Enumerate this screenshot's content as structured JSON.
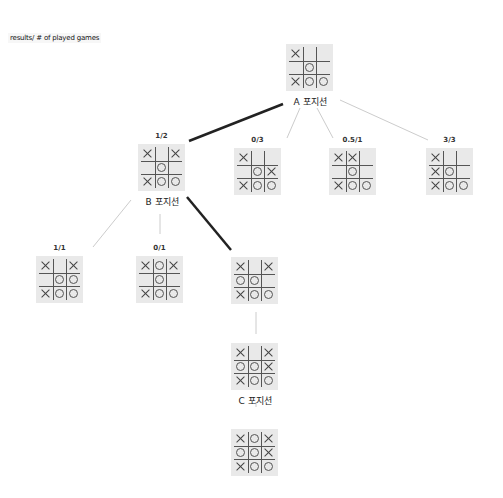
{
  "legend": "results/ # of played games",
  "colors": {
    "board_bg": "#e9e9e9",
    "strong_edge": "#222222",
    "weak_edge": "#cccccc"
  },
  "boards": [
    {
      "id": "A",
      "score": "",
      "position_label": "A 포지션",
      "x": 286,
      "y": 44,
      "cells": [
        "X",
        "",
        "",
        "",
        "O",
        "",
        "X",
        "O",
        "O"
      ]
    },
    {
      "id": "B",
      "score": "1/2",
      "position_label": "B 포지션",
      "x": 138,
      "y": 144,
      "cells": [
        "X",
        "",
        "X",
        "",
        "O",
        "",
        "X",
        "O",
        "O"
      ]
    },
    {
      "id": "A2",
      "score": "0/3",
      "position_label": "",
      "x": 234,
      "y": 148,
      "cells": [
        "X",
        "",
        "",
        "",
        "O",
        "X",
        "X",
        "O",
        "O"
      ]
    },
    {
      "id": "A3",
      "score": "0.5/1",
      "position_label": "",
      "x": 329,
      "y": 148,
      "cells": [
        "X",
        "X",
        "",
        "",
        "O",
        "",
        "X",
        "O",
        "O"
      ]
    },
    {
      "id": "A4",
      "score": "3/3",
      "position_label": "",
      "x": 426,
      "y": 148,
      "cells": [
        "X",
        "",
        "",
        "X",
        "O",
        "",
        "X",
        "O",
        "O"
      ]
    },
    {
      "id": "B1",
      "score": "1/1",
      "position_label": "",
      "x": 36,
      "y": 256,
      "cells": [
        "X",
        "",
        "X",
        "",
        "O",
        "O",
        "X",
        "O",
        "O"
      ]
    },
    {
      "id": "B2",
      "score": "0/1",
      "position_label": "",
      "x": 136,
      "y": 256,
      "cells": [
        "X",
        "O",
        "X",
        "",
        "O",
        "",
        "X",
        "O",
        "O"
      ]
    },
    {
      "id": "B3",
      "score": "",
      "position_label": "",
      "x": 231,
      "y": 257,
      "cells": [
        "X",
        "",
        "X",
        "O",
        "O",
        "",
        "X",
        "O",
        "O"
      ]
    },
    {
      "id": "C",
      "score": "",
      "position_label": "C 포지션",
      "x": 231,
      "y": 343,
      "cells": [
        "X",
        "",
        "X",
        "O",
        "O",
        "X",
        "X",
        "O",
        "O"
      ]
    },
    {
      "id": "C1",
      "score": "",
      "position_label": "",
      "x": 231,
      "y": 429,
      "cells": [
        "X",
        "O",
        "X",
        "O",
        "O",
        "X",
        "X",
        "O",
        "O"
      ]
    }
  ],
  "edges": [
    {
      "from": "A",
      "to": "B",
      "x1": 283,
      "y1": 104,
      "x2": 189,
      "y2": 141,
      "weight": "strong"
    },
    {
      "from": "A",
      "to": "A2",
      "x1": 300,
      "y1": 108,
      "x2": 287,
      "y2": 138,
      "weight": "weak"
    },
    {
      "from": "A",
      "to": "A3",
      "x1": 317,
      "y1": 108,
      "x2": 333,
      "y2": 138,
      "weight": "weak"
    },
    {
      "from": "A",
      "to": "A4",
      "x1": 340,
      "y1": 100,
      "x2": 428,
      "y2": 140,
      "weight": "weak"
    },
    {
      "from": "B",
      "to": "B1",
      "x1": 131,
      "y1": 200,
      "x2": 93,
      "y2": 247,
      "weight": "weak"
    },
    {
      "from": "B",
      "to": "B2",
      "x1": 160,
      "y1": 214,
      "x2": 160,
      "y2": 234,
      "weight": "weak"
    },
    {
      "from": "B",
      "to": "B3",
      "x1": 187,
      "y1": 197,
      "x2": 231,
      "y2": 250,
      "weight": "strong"
    },
    {
      "from": "B3",
      "to": "C",
      "x1": 256,
      "y1": 312,
      "x2": 256,
      "y2": 334,
      "weight": "weak"
    },
    {
      "from": "C",
      "to": "C1",
      "x1": 256,
      "y1": 402,
      "x2": 256,
      "y2": 407,
      "weight": "weak"
    }
  ]
}
